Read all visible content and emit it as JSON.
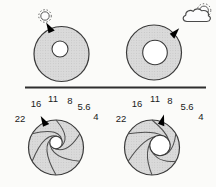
{
  "colors": {
    "background": "#fbfbf9",
    "disc_fill": "#d9d9d9",
    "outline": "#3a3a3a",
    "pointer": "#000000",
    "label_text": "#1a1a1a"
  },
  "top_row": {
    "left": {
      "icon": "sun-icon",
      "pupil_size": "small"
    },
    "right": {
      "icon": "sun-behind-cloud-icon",
      "pupil_size": "large"
    }
  },
  "fstops": [
    "22",
    "16",
    "11",
    "8",
    "5.6",
    "4"
  ],
  "bottom_row": {
    "left": {
      "selected_fstop": "16",
      "opening_size": "small"
    },
    "right": {
      "selected_fstop": "8",
      "opening_size": "large"
    }
  }
}
